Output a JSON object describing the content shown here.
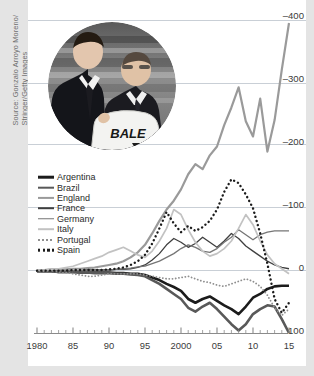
{
  "credit": {
    "text": "Source: Gonzalo Arroyo Moreno/\nStringer/Getty Images"
  },
  "photo": {
    "alt_name": "gareth-bale-real-madrid-presentation-photo",
    "jersey_text": "BALE"
  },
  "chart_data": {
    "type": "line",
    "title": "",
    "subtitle": "",
    "xlabel": "",
    "ylabel": "",
    "grid": true,
    "legend_position": "inside-left",
    "y_axis_inverted": true,
    "ylim": [
      -420,
      110
    ],
    "xlim": [
      1980,
      2015
    ],
    "y_ticks": [
      -400,
      -300,
      -200,
      -100,
      0,
      100
    ],
    "y_tick_labels": [
      "–400",
      "–300",
      "–200",
      "–100",
      "0",
      "100"
    ],
    "x_ticks": [
      1980,
      1985,
      1990,
      1995,
      2000,
      2005,
      2010,
      2015
    ],
    "x_tick_labels": [
      "1980",
      "85",
      "90",
      "95",
      "2000",
      "05",
      "10",
      "15"
    ],
    "x_minor_tick_interval": 1,
    "x": [
      1980,
      1981,
      1982,
      1983,
      1984,
      1985,
      1986,
      1987,
      1988,
      1989,
      1990,
      1991,
      1992,
      1993,
      1994,
      1995,
      1996,
      1997,
      1998,
      1999,
      2000,
      2001,
      2002,
      2003,
      2004,
      2005,
      2006,
      2007,
      2008,
      2009,
      2010,
      2011,
      2012,
      2013,
      2014,
      2015
    ],
    "series": [
      {
        "name": "Argentina",
        "color": "#1c1c1c",
        "width": 2.6,
        "style": "solid",
        "values": [
          2,
          2,
          2,
          3,
          3,
          3,
          4,
          4,
          4,
          4,
          4,
          5,
          5,
          6,
          6,
          8,
          12,
          16,
          22,
          27,
          33,
          46,
          52,
          46,
          42,
          49,
          56,
          62,
          70,
          58,
          44,
          38,
          30,
          26,
          25,
          25
        ]
      },
      {
        "name": "Brazil",
        "color": "#595959",
        "width": 2.6,
        "style": "solid",
        "values": [
          2,
          2,
          2,
          3,
          3,
          3,
          4,
          4,
          5,
          5,
          5,
          6,
          6,
          7,
          8,
          10,
          16,
          22,
          30,
          38,
          46,
          60,
          66,
          58,
          52,
          62,
          74,
          86,
          96,
          86,
          70,
          62,
          56,
          58,
          78,
          100
        ]
      },
      {
        "name": "England",
        "color": "#9a9a9a",
        "width": 2.2,
        "style": "solid",
        "values": [
          0,
          0,
          -1,
          -1,
          -1,
          -2,
          -2,
          -3,
          -4,
          -6,
          -8,
          -10,
          -14,
          -20,
          -28,
          -40,
          -58,
          -78,
          -96,
          -110,
          -128,
          -152,
          -168,
          -160,
          -182,
          -196,
          -230,
          -258,
          -290,
          -236,
          -212,
          -272,
          -188,
          -238,
          -318,
          -392
        ]
      },
      {
        "name": "France",
        "color": "#3f3f3f",
        "width": 1.3,
        "style": "solid",
        "values": [
          1,
          1,
          1,
          1,
          1,
          1,
          1,
          0,
          0,
          0,
          0,
          -1,
          -1,
          -2,
          -4,
          -8,
          -16,
          -26,
          -40,
          -50,
          -44,
          -36,
          -42,
          -52,
          -44,
          -36,
          -46,
          -58,
          -50,
          -38,
          -30,
          -22,
          -14,
          -8,
          -4,
          -2
        ]
      },
      {
        "name": "Germany",
        "color": "#757575",
        "width": 1.3,
        "style": "solid",
        "values": [
          1,
          1,
          1,
          1,
          1,
          1,
          1,
          1,
          0,
          0,
          0,
          -1,
          -2,
          -3,
          -5,
          -6,
          -10,
          -14,
          -20,
          -26,
          -34,
          -40,
          -36,
          -30,
          -28,
          -34,
          -44,
          -52,
          -64,
          -56,
          -48,
          -56,
          -60,
          -62,
          -62,
          -62
        ]
      },
      {
        "name": "Italy",
        "color": "#c2c2c2",
        "width": 1.7,
        "style": "solid",
        "values": [
          0,
          0,
          -1,
          -2,
          -4,
          -6,
          -10,
          -14,
          -18,
          -22,
          -28,
          -32,
          -36,
          -30,
          -24,
          -20,
          -30,
          -46,
          -66,
          -96,
          -88,
          -64,
          -44,
          -30,
          -22,
          -26,
          -34,
          -46,
          -66,
          -88,
          -72,
          -46,
          -24,
          -10,
          -2,
          6
        ]
      },
      {
        "name": "Portugal",
        "color": "#8f8f8f",
        "width": 1.8,
        "style": "dotted",
        "values": [
          2,
          2,
          2,
          3,
          4,
          6,
          8,
          10,
          10,
          8,
          6,
          6,
          6,
          6,
          6,
          8,
          10,
          12,
          14,
          14,
          12,
          10,
          14,
          18,
          20,
          24,
          26,
          22,
          18,
          14,
          18,
          26,
          40,
          60,
          72,
          62
        ]
      },
      {
        "name": "Spain",
        "color": "#1c1c1c",
        "width": 2.4,
        "style": "dotted",
        "values": [
          1,
          1,
          1,
          1,
          1,
          0,
          0,
          0,
          0,
          0,
          -1,
          -2,
          -4,
          -8,
          -14,
          -24,
          -42,
          -66,
          -92,
          -74,
          -60,
          -70,
          -62,
          -68,
          -78,
          -96,
          -124,
          -144,
          -138,
          -120,
          -98,
          -58,
          -10,
          46,
          68,
          52
        ]
      }
    ]
  },
  "axis_labels": {
    "y": [
      "–400",
      "–300",
      "–200",
      "–100",
      "0",
      "100"
    ],
    "x": [
      "1980",
      "85",
      "90",
      "95",
      "2000",
      "05",
      "10",
      "15"
    ]
  }
}
